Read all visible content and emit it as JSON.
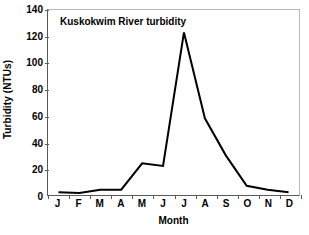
{
  "chart_data": {
    "type": "line",
    "title": "Kuskokwim River turbidity",
    "xlabel": "Month",
    "ylabel": "Turbidity (NTUs)",
    "categories": [
      "J",
      "F",
      "M",
      "A",
      "M",
      "J",
      "J",
      "A",
      "S",
      "O",
      "N",
      "D"
    ],
    "category_names": [
      "January",
      "February",
      "March",
      "April",
      "May",
      "June",
      "July",
      "August",
      "September",
      "October",
      "November",
      "December"
    ],
    "values": [
      2,
      1.5,
      4,
      4,
      24,
      22,
      123,
      58,
      30,
      7,
      4,
      2
    ],
    "series": [
      {
        "name": "Turbidity",
        "values": [
          2,
          1.5,
          4,
          4,
          24,
          22,
          123,
          58,
          30,
          7,
          4,
          2
        ],
        "color": "#000000"
      }
    ],
    "ylim": [
      0,
      140
    ],
    "yticks": [
      0,
      20,
      40,
      60,
      80,
      100,
      120,
      140
    ],
    "ytick_labels": [
      "0",
      "20",
      "40",
      "60",
      "80",
      "100",
      "120",
      "140"
    ],
    "grid": false,
    "legend": "none",
    "line_color": "#000000",
    "line_width": 2,
    "markers": "none",
    "background_color": "#ffffff",
    "frame_color": "#b8b8b8",
    "axis_color": "#5a5a5a"
  }
}
